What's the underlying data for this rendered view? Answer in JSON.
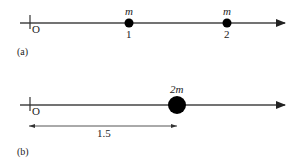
{
  "panel_a": {
    "label": "(a)",
    "origin_label": "O",
    "masses": [
      {
        "mass_label": "m",
        "position_label": "1",
        "x": 1
      },
      {
        "mass_label": "m",
        "position_label": "2",
        "x": 2
      }
    ]
  },
  "panel_b": {
    "label": "(b)",
    "origin_label": "O",
    "mass": {
      "mass_label": "2m",
      "x": 1.5
    },
    "distance_label": "1.5"
  },
  "colors": {
    "line": "#444444",
    "mass": "#000000",
    "text": "#222222"
  }
}
